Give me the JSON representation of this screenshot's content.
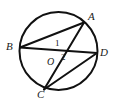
{
  "figure": {
    "header_fragment": "",
    "stroke_color": "#111111",
    "background_color": "#ffffff",
    "canvas": {
      "width": 116,
      "height": 101
    }
  },
  "chart_data": {
    "type": "diagram",
    "subtype": "euclidean-geometry",
    "xlabel": "",
    "ylabel": "",
    "circle": {
      "label": "O",
      "center": {
        "x": 58.5,
        "y": 51.0
      },
      "radius": 39.0,
      "stroke_width": 2.0
    },
    "points": [
      {
        "name": "A",
        "x": 84.0,
        "y": 22.5,
        "label": "A",
        "label_x": 88,
        "label_y": 11,
        "on_circle": true
      },
      {
        "name": "B",
        "x": 20.0,
        "y": 47.5,
        "label": "B",
        "label_x": 6,
        "label_y": 41,
        "on_circle": true
      },
      {
        "name": "C",
        "x": 44.0,
        "y": 89.5,
        "label": "C",
        "label_x": 37,
        "label_y": 89,
        "on_circle": true
      },
      {
        "name": "D",
        "x": 97.0,
        "y": 53.0,
        "label": "D",
        "label_x": 100,
        "label_y": 47,
        "on_circle": true
      },
      {
        "name": "O",
        "x": 58.5,
        "y": 56.0,
        "label": "O",
        "label_x": 47,
        "label_y": 57,
        "on_circle": false
      }
    ],
    "segments": [
      {
        "from": "B",
        "to": "A",
        "kind": "chord"
      },
      {
        "from": "B",
        "to": "D",
        "kind": "diameter-through-O"
      },
      {
        "from": "A",
        "to": "C",
        "kind": "chord-through-O"
      },
      {
        "from": "C",
        "to": "D",
        "kind": "chord"
      }
    ],
    "angle_labels": [
      {
        "text": "1",
        "x": 56,
        "y": 43,
        "describes": "angle at O above line BD, between OB-OD and OA"
      },
      {
        "text": "2",
        "x": 62,
        "y": 57,
        "describes": "angle at O below line BD, between OD and OC"
      }
    ],
    "legend": [],
    "grid": false
  }
}
